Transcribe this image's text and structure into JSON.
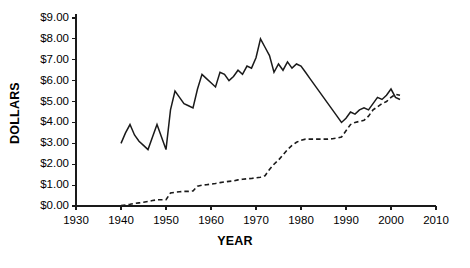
{
  "chart_data": {
    "type": "line",
    "title": "",
    "xlabel": "YEAR",
    "ylabel": "DOLLARS",
    "xlim": [
      1930,
      2010
    ],
    "ylim": [
      0,
      9
    ],
    "xticks": [
      1930,
      1940,
      1950,
      1960,
      1970,
      1980,
      1990,
      2000,
      2010
    ],
    "xtick_labels": [
      "1930",
      "1940",
      "1950",
      "1960",
      "1970",
      "1980",
      "1990",
      "2000",
      "2010"
    ],
    "yticks": [
      0,
      1,
      2,
      3,
      4,
      5,
      6,
      7,
      8,
      9
    ],
    "ytick_labels": [
      "$0.00",
      "$1.00",
      "$2.00",
      "$3.00",
      "$4.00",
      "$5.00",
      "$6.00",
      "$7.00",
      "$8.00",
      "$9.00"
    ],
    "grid": false,
    "legend": "none",
    "axis_color": "#1a1a1a",
    "series": [
      {
        "name": "solid-series",
        "style": "solid",
        "color": "#1a1a1a",
        "x": [
          1940,
          1941,
          1942,
          1943,
          1944,
          1945,
          1946,
          1947,
          1948,
          1949,
          1950,
          1951,
          1952,
          1953,
          1954,
          1955,
          1956,
          1957,
          1958,
          1959,
          1960,
          1961,
          1962,
          1963,
          1964,
          1965,
          1966,
          1967,
          1968,
          1969,
          1970,
          1971,
          1972,
          1973,
          1974,
          1975,
          1976,
          1977,
          1978,
          1979,
          1980,
          1981,
          1982,
          1983,
          1984,
          1985,
          1986,
          1987,
          1988,
          1989,
          1990,
          1991,
          1992,
          1993,
          1994,
          1995,
          1996,
          1997,
          1998,
          1999,
          2000,
          2001,
          2002
        ],
        "y": [
          3.0,
          3.5,
          3.9,
          3.4,
          3.1,
          2.9,
          2.7,
          3.3,
          3.9,
          3.3,
          2.7,
          4.6,
          5.5,
          5.2,
          4.9,
          4.8,
          4.7,
          5.6,
          6.3,
          6.1,
          5.9,
          5.7,
          6.4,
          6.3,
          6.0,
          6.2,
          6.5,
          6.3,
          6.7,
          6.6,
          7.1,
          8.0,
          7.6,
          7.2,
          6.4,
          6.8,
          6.5,
          6.9,
          6.6,
          6.8,
          6.7,
          6.4,
          6.1,
          5.8,
          5.5,
          5.2,
          4.9,
          4.6,
          4.3,
          4.0,
          4.2,
          4.5,
          4.4,
          4.6,
          4.7,
          4.6,
          4.9,
          5.2,
          5.1,
          5.3,
          5.6,
          5.2,
          5.1
        ]
      },
      {
        "name": "dashed-series",
        "style": "dashed",
        "color": "#1a1a1a",
        "x": [
          1940,
          1941,
          1942,
          1943,
          1944,
          1945,
          1946,
          1947,
          1948,
          1949,
          1950,
          1951,
          1952,
          1953,
          1954,
          1955,
          1956,
          1957,
          1958,
          1959,
          1960,
          1961,
          1962,
          1963,
          1964,
          1965,
          1966,
          1967,
          1968,
          1969,
          1970,
          1971,
          1972,
          1973,
          1974,
          1975,
          1976,
          1977,
          1978,
          1979,
          1980,
          1981,
          1982,
          1983,
          1984,
          1985,
          1986,
          1987,
          1988,
          1989,
          1990,
          1991,
          1992,
          1993,
          1994,
          1995,
          1996,
          1997,
          1998,
          1999,
          2000,
          2001,
          2002
        ],
        "y": [
          0.02,
          0.05,
          0.08,
          0.12,
          0.15,
          0.18,
          0.22,
          0.26,
          0.3,
          0.3,
          0.3,
          0.62,
          0.66,
          0.68,
          0.7,
          0.7,
          0.72,
          0.95,
          1.0,
          1.02,
          1.05,
          1.08,
          1.12,
          1.15,
          1.18,
          1.2,
          1.25,
          1.28,
          1.3,
          1.32,
          1.35,
          1.38,
          1.45,
          1.75,
          2.0,
          2.2,
          2.45,
          2.7,
          2.9,
          3.05,
          3.15,
          3.2,
          3.2,
          3.2,
          3.2,
          3.2,
          3.2,
          3.22,
          3.25,
          3.3,
          3.6,
          3.9,
          4.0,
          4.05,
          4.1,
          4.3,
          4.6,
          4.75,
          4.9,
          5.0,
          5.2,
          5.35,
          5.3
        ]
      }
    ]
  }
}
